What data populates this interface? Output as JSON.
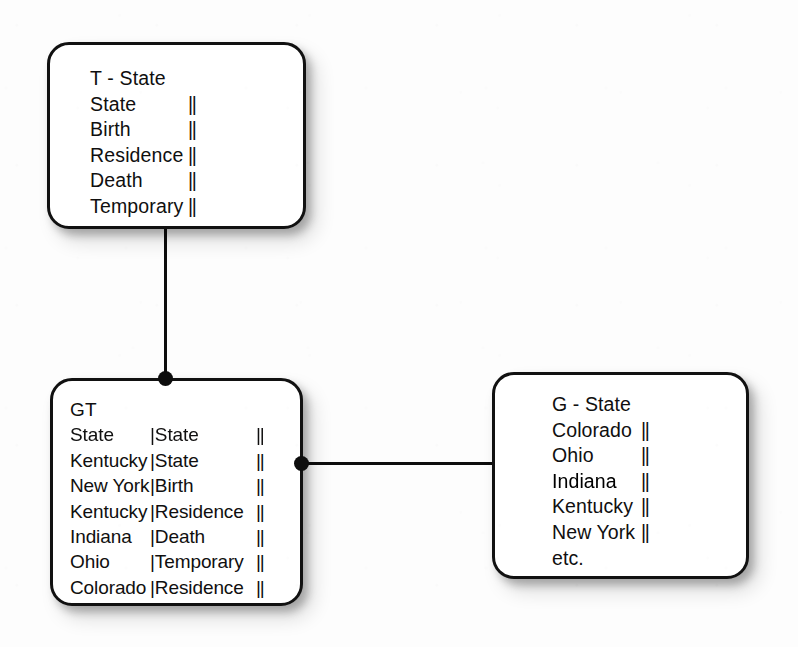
{
  "diagram": {
    "background_color": "#ffffff",
    "line_color": "#0d0d0d",
    "text_color": "#100f0f"
  },
  "nodes": {
    "tstate": {
      "title": "T - State",
      "rows": [
        {
          "name": "State",
          "bars": "||"
        },
        {
          "name": "Birth",
          "bars": "||"
        },
        {
          "name": "Residence",
          "bars": "||"
        },
        {
          "name": "Death",
          "bars": "||"
        },
        {
          "name": "Temporary",
          "bars": "||"
        }
      ]
    },
    "gt": {
      "title": "GT",
      "rows": [
        {
          "state": "State",
          "attr": "|State",
          "bars": "||"
        },
        {
          "state": "Kentucky",
          "attr": "|State",
          "bars": "||"
        },
        {
          "state": "New York",
          "attr": "|Birth",
          "bars": "||"
        },
        {
          "state": "Kentucky",
          "attr": "|Residence",
          "bars": "||"
        },
        {
          "state": "Indiana",
          "attr": "|Death",
          "bars": "||"
        },
        {
          "state": "Ohio",
          "attr": "|Temporary",
          "bars": "||"
        },
        {
          "state": "Colorado",
          "attr": "|Residence",
          "bars": "||"
        }
      ]
    },
    "gstate": {
      "title": "G - State",
      "rows": [
        {
          "name": "Colorado",
          "bars": "||"
        },
        {
          "name": "Ohio",
          "bars": "||"
        },
        {
          "name": "Indiana",
          "bars": "||"
        },
        {
          "name": "Kentucky",
          "bars": "||"
        },
        {
          "name": "New York",
          "bars": "||"
        },
        {
          "name": "etc.",
          "bars": ""
        }
      ]
    }
  },
  "edges": [
    {
      "id": "tstate-gt",
      "from": "tstate",
      "to": "gt",
      "orientation": "vertical"
    },
    {
      "id": "gt-gstate",
      "from": "gt",
      "to": "gstate",
      "orientation": "horizontal"
    }
  ]
}
